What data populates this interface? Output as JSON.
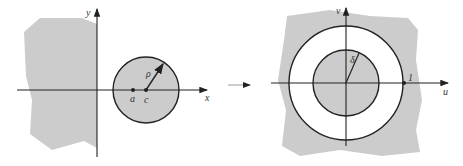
{
  "figure": {
    "left_panel": {
      "axes": {
        "x_label": "x",
        "y_label": "y"
      },
      "labels": {
        "center": "c",
        "point": "a",
        "radius": "ρ"
      },
      "colors": {
        "fill": "#cccccc",
        "stroke": "#222222"
      }
    },
    "right_panel": {
      "axes": {
        "x_label": "u",
        "y_label": "v"
      },
      "labels": {
        "inner_radius": "δ",
        "unit_point": "1"
      },
      "colors": {
        "fill": "#cccccc",
        "annulus": "#ffffff",
        "stroke": "#222222"
      }
    },
    "mapping_arrow": "→"
  }
}
